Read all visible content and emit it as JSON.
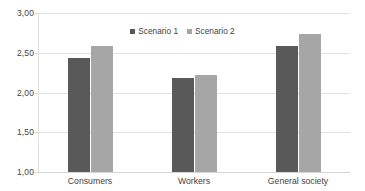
{
  "chart_data": {
    "type": "bar",
    "title": "",
    "subtitle": "",
    "xlabel": "",
    "ylabel": "",
    "categories": [
      "Consumers",
      "Workers",
      "General society"
    ],
    "series": [
      {
        "name": "Scenario 1",
        "color": "#595959",
        "values": [
          2.43,
          2.18,
          2.58
        ]
      },
      {
        "name": "Scenario 2",
        "color": "#a6a6a6",
        "values": [
          2.58,
          2.22,
          2.74
        ]
      }
    ],
    "ylim": [
      1.0,
      3.0
    ],
    "ytick_labels": [
      "3,00",
      "2,50",
      "2,00",
      "1,50",
      "1,00"
    ],
    "ytick_values": [
      3.0,
      2.5,
      2.0,
      1.5,
      1.0
    ],
    "grid": true,
    "grid_axis": "y",
    "legend_position": "top-center",
    "decimal_separator": ",",
    "annotations": []
  },
  "legend": {
    "entries": [
      {
        "label": "Scenario 1",
        "swatch": "legend-swatch-scenario-1"
      },
      {
        "label": "Scenario 2",
        "swatch": "legend-swatch-scenario-2"
      }
    ]
  }
}
